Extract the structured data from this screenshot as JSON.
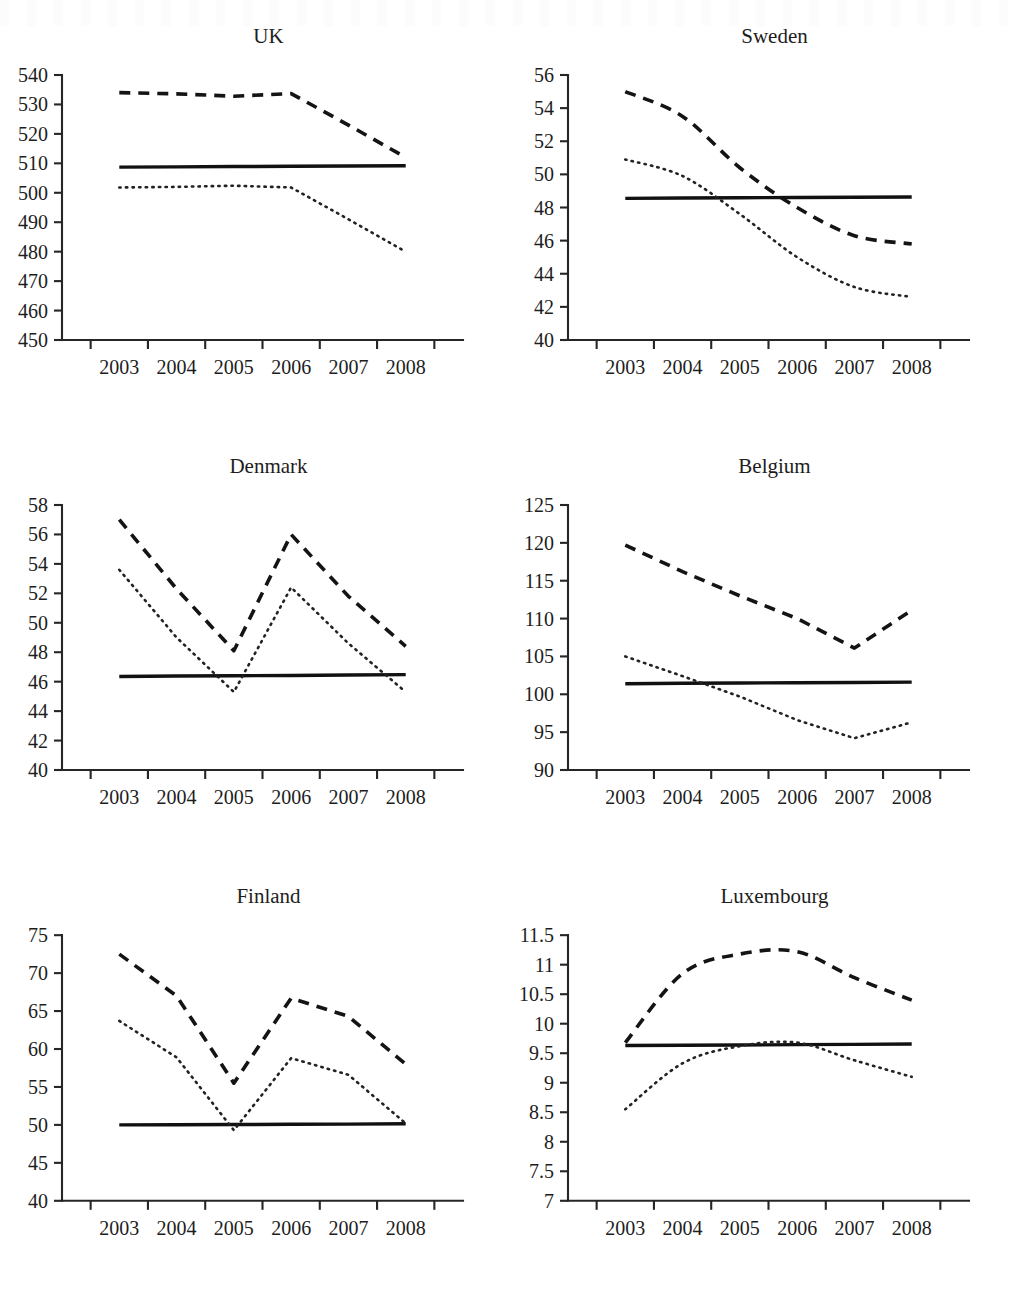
{
  "figure": {
    "panel_layout": "3 rows x 2 columns",
    "x_categories": [
      "2003",
      "2004",
      "2005",
      "2006",
      "2007",
      "2008"
    ],
    "series_styles": [
      "dashed",
      "solid",
      "dotted"
    ]
  },
  "chart_data": [
    {
      "type": "line",
      "title": "UK",
      "xlabel": "",
      "ylabel": "",
      "x": [
        "2003",
        "2004",
        "2005",
        "2006",
        "2007",
        "2008"
      ],
      "ylim": [
        450,
        540
      ],
      "yticks": [
        450,
        460,
        470,
        480,
        490,
        500,
        510,
        520,
        530,
        540
      ],
      "ytick_labels": [
        "450",
        "460",
        "470",
        "480",
        "490",
        "500",
        "510",
        "520",
        "530",
        "540"
      ],
      "grid": false,
      "legend": "none",
      "series": [
        {
          "name": "upper",
          "style": "dashed",
          "values": [
            534.0,
            533.6,
            532.8,
            533.7,
            523.0,
            512.0
          ]
        },
        {
          "name": "middle",
          "style": "solid",
          "values": [
            508.7,
            508.8,
            508.9,
            509.0,
            509.1,
            509.2
          ]
        },
        {
          "name": "lower",
          "style": "dotted",
          "values": [
            501.8,
            502.0,
            502.4,
            501.8,
            491.0,
            480.0
          ]
        }
      ]
    },
    {
      "type": "line",
      "title": "Sweden",
      "xlabel": "",
      "ylabel": "",
      "x": [
        "2003",
        "2004",
        "2005",
        "2006",
        "2007",
        "2008"
      ],
      "ylim": [
        40,
        56
      ],
      "yticks": [
        40,
        42,
        44,
        46,
        48,
        50,
        52,
        54,
        56
      ],
      "ytick_labels": [
        "40",
        "42",
        "44",
        "46",
        "48",
        "50",
        "52",
        "54",
        "56"
      ],
      "grid": false,
      "legend": "none",
      "series": [
        {
          "name": "upper",
          "style": "dashed",
          "values": [
            55.0,
            53.5,
            50.4,
            48.0,
            46.3,
            45.8
          ]
        },
        {
          "name": "middle",
          "style": "solid",
          "values": [
            48.55,
            48.57,
            48.59,
            48.6,
            48.62,
            48.63
          ]
        },
        {
          "name": "lower",
          "style": "dotted",
          "values": [
            50.9,
            49.9,
            47.6,
            45.0,
            43.2,
            42.6
          ]
        }
      ]
    },
    {
      "type": "line",
      "title": "Denmark",
      "xlabel": "",
      "ylabel": "",
      "x": [
        "2003",
        "2004",
        "2005",
        "2006",
        "2007",
        "2008"
      ],
      "ylim": [
        40,
        58
      ],
      "yticks": [
        40,
        42,
        44,
        46,
        48,
        50,
        52,
        54,
        56,
        58
      ],
      "ytick_labels": [
        "40",
        "42",
        "44",
        "46",
        "48",
        "50",
        "52",
        "54",
        "56",
        "58"
      ],
      "grid": false,
      "legend": "none",
      "series": [
        {
          "name": "upper",
          "style": "dashed",
          "values": [
            57.0,
            52.3,
            48.1,
            56.0,
            51.8,
            48.4
          ]
        },
        {
          "name": "middle",
          "style": "solid",
          "values": [
            46.35,
            46.38,
            46.4,
            46.42,
            46.45,
            46.48
          ]
        },
        {
          "name": "lower",
          "style": "dotted",
          "values": [
            53.6,
            49.0,
            45.3,
            52.4,
            48.6,
            45.3
          ]
        }
      ]
    },
    {
      "type": "line",
      "title": "Belgium",
      "xlabel": "",
      "ylabel": "",
      "x": [
        "2003",
        "2004",
        "2005",
        "2006",
        "2007",
        "2008"
      ],
      "ylim": [
        90,
        125
      ],
      "yticks": [
        90,
        95,
        100,
        105,
        110,
        115,
        120,
        125
      ],
      "ytick_labels": [
        "90",
        "95",
        "100",
        "105",
        "110",
        "115",
        "120",
        "125"
      ],
      "grid": false,
      "legend": "none",
      "series": [
        {
          "name": "upper",
          "style": "dashed",
          "values": [
            119.7,
            116.2,
            113.0,
            110.0,
            106.1,
            111.1
          ]
        },
        {
          "name": "middle",
          "style": "solid",
          "values": [
            101.4,
            101.45,
            101.5,
            101.52,
            101.55,
            101.6
          ]
        },
        {
          "name": "lower",
          "style": "dotted",
          "values": [
            105.0,
            102.4,
            99.7,
            96.6,
            94.2,
            96.3
          ]
        }
      ]
    },
    {
      "type": "line",
      "title": "Finland",
      "xlabel": "",
      "ylabel": "",
      "x": [
        "2003",
        "2004",
        "2005",
        "2006",
        "2007",
        "2008"
      ],
      "ylim": [
        40,
        75
      ],
      "yticks": [
        40,
        45,
        50,
        55,
        60,
        65,
        70,
        75
      ],
      "ytick_labels": [
        "40",
        "45",
        "50",
        "55",
        "60",
        "65",
        "70",
        "75"
      ],
      "grid": false,
      "legend": "none",
      "series": [
        {
          "name": "upper",
          "style": "dashed",
          "values": [
            72.5,
            67.0,
            55.5,
            66.7,
            64.3,
            58.0
          ]
        },
        {
          "name": "middle",
          "style": "solid",
          "values": [
            50.0,
            50.02,
            50.05,
            50.08,
            50.1,
            50.15
          ]
        },
        {
          "name": "lower",
          "style": "dotted",
          "values": [
            63.7,
            58.9,
            49.3,
            58.8,
            56.6,
            50.2
          ]
        }
      ]
    },
    {
      "type": "line",
      "title": "Luxembourg",
      "xlabel": "",
      "ylabel": "",
      "x": [
        "2003",
        "2004",
        "2005",
        "2006",
        "2007",
        "2008"
      ],
      "ylim": [
        7,
        11.5
      ],
      "yticks": [
        7,
        7.5,
        8,
        8.5,
        9,
        9.5,
        10,
        10.5,
        11,
        11.5
      ],
      "ytick_labels": [
        "7",
        "7.5",
        "8",
        "8.5",
        "9",
        "9.5",
        "10",
        "10.5",
        "11",
        "11.5"
      ],
      "grid": false,
      "legend": "none",
      "series": [
        {
          "name": "upper",
          "style": "dashed",
          "values": [
            9.68,
            10.85,
            11.18,
            11.22,
            10.78,
            10.4
          ]
        },
        {
          "name": "middle",
          "style": "solid",
          "values": [
            9.63,
            9.635,
            9.64,
            9.645,
            9.65,
            9.655
          ]
        },
        {
          "name": "lower",
          "style": "dotted",
          "values": [
            8.55,
            9.33,
            9.62,
            9.68,
            9.38,
            9.1
          ]
        }
      ]
    }
  ]
}
